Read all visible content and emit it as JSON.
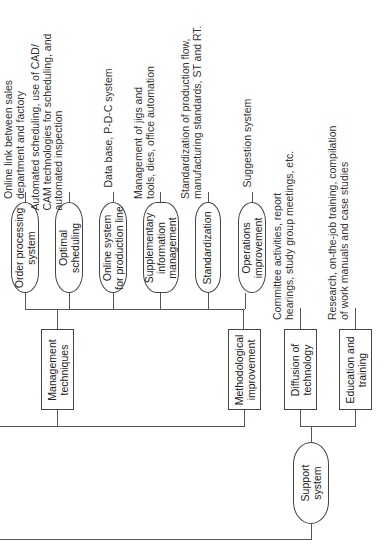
{
  "diagram": {
    "type": "tree",
    "orientation": "rotated-90",
    "colors": {
      "line": "#555555",
      "text": "#222222",
      "background": "#ffffff"
    },
    "branches": [
      {
        "label": "Management\ntechniques",
        "shape": "rect",
        "children": [
          {
            "label": "Order processing\nsystem",
            "shape": "pill",
            "desc": "Online link between sales\ndepartment and factory"
          },
          {
            "label": "Optimal\nscheduling",
            "shape": "pill",
            "desc": "Automated scheduling, use of CAD/\nCAM technologies for scheduling, and\nautomated inspection"
          },
          {
            "label": "Online system\nfor production line",
            "shape": "pill",
            "desc": "Data base, P-D-C system"
          },
          {
            "label": "Supplementary\ninformation\nmanagement",
            "shape": "pill",
            "desc": "Management of jigs and\ntools, dies, office automation"
          }
        ]
      },
      {
        "label": "Methodological\nimprovement",
        "shape": "rect",
        "children": [
          {
            "label": "Standardization",
            "shape": "pill",
            "desc": "Standardization of production flow,\nmanufacturing standards, ST and RT."
          },
          {
            "label": "Operations\nimprovement",
            "shape": "pill",
            "desc": "Suggestion system"
          }
        ]
      },
      {
        "label": "Support\nsystem",
        "shape": "pill",
        "children": [
          {
            "label": "Diffusion of\ntechnology",
            "shape": "rect",
            "desc": "Committee activities, report\nhearings, study group meetings, etc."
          },
          {
            "label": "Education and\ntraining",
            "shape": "rect",
            "desc": "Research, on-the-job training, compilation\nof work manuals and case studies"
          }
        ]
      }
    ]
  }
}
